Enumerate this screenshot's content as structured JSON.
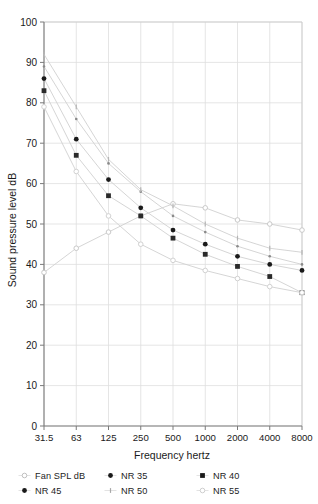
{
  "chart_data": {
    "type": "line",
    "title": "",
    "xlabel": "Frequency hertz",
    "ylabel": "Sound pressure level dB",
    "x_scale": "octave-band",
    "categories": [
      "31.5",
      "63",
      "125",
      "250",
      "500",
      "1000",
      "2000",
      "4000",
      "8000"
    ],
    "xtick_labels": [
      "31.5",
      "63",
      "125",
      "250",
      "500",
      "1000",
      "2000",
      "4000",
      "8000"
    ],
    "ytick_labels": [
      "0",
      "10",
      "20",
      "30",
      "40",
      "50",
      "60",
      "70",
      "80",
      "90",
      "100"
    ],
    "ylim": [
      0,
      100
    ],
    "ystep": 10,
    "grid": true,
    "legend_position": "bottom",
    "series": [
      {
        "name": "Fan SPL dB",
        "marker": "open-circle",
        "color": "#c9c9c9",
        "values": [
          38,
          44,
          48,
          52,
          55,
          54,
          51,
          50,
          48.5
        ]
      },
      {
        "name": "NR 35",
        "marker": "small-dot",
        "color": "#8a8a8a",
        "values": [
          89,
          76,
          65,
          58,
          52,
          48,
          44.5,
          42,
          40
        ]
      },
      {
        "name": "NR 40",
        "marker": "square",
        "color": "#2a2a2a",
        "values": [
          83,
          67,
          57,
          52,
          46.5,
          42.5,
          39.5,
          37,
          33
        ]
      },
      {
        "name": "NR 45",
        "marker": "dot",
        "color": "#1a1a1a",
        "values": [
          86,
          71,
          61,
          54,
          48.5,
          45,
          42,
          40,
          38.5
        ]
      },
      {
        "name": "NR 50",
        "marker": "tick",
        "color": "#b5b5b5",
        "values": [
          92,
          79,
          66,
          58.5,
          54.5,
          50,
          46.5,
          44,
          43
        ]
      },
      {
        "name": "NR 55",
        "marker": "open-circle-lite",
        "color": "#d2d2d2",
        "values": [
          79,
          63,
          52,
          45,
          41,
          38.5,
          36.5,
          34.5,
          33
        ]
      }
    ],
    "extra_series_note": "",
    "plotted_points": {
      "NR35_filled": [
        89,
        76,
        65,
        58,
        52,
        48,
        44.5,
        42,
        40
      ],
      "NR40_filled": [
        83,
        67,
        57,
        52,
        46.5,
        42.5,
        39.5,
        37,
        33
      ],
      "NR45_filled": [
        86,
        71,
        61,
        54,
        48.5,
        45,
        42,
        40,
        38.5
      ],
      "NR55_filled": [
        79,
        63,
        52,
        45,
        41,
        38.5,
        36.5,
        34.5,
        27.5
      ]
    }
  },
  "axes": {
    "ylabel": "Sound pressure level dB",
    "xlabel": "Frequency hertz",
    "y_ticks": [
      "100",
      "90",
      "80",
      "70",
      "60",
      "50",
      "40",
      "30",
      "20",
      "10",
      "0"
    ],
    "x_ticks": [
      "31.5",
      "63",
      "125",
      "250",
      "500",
      "1000",
      "2000",
      "4000",
      "8000"
    ]
  },
  "legend": {
    "items": [
      {
        "label": "Fan SPL dB",
        "marker": "open-circle",
        "color": "#c0c0c0"
      },
      {
        "label": "NR 35",
        "marker": "dot",
        "color": "#1a1a1a"
      },
      {
        "label": "NR 40",
        "marker": "square",
        "color": "#1a1a1a"
      },
      {
        "label": "NR 45",
        "marker": "dot",
        "color": "#1a1a1a"
      },
      {
        "label": "NR 50",
        "marker": "tick",
        "color": "#a8a8a8"
      },
      {
        "label": "NR 55",
        "marker": "open-circle",
        "color": "#cfcfcf"
      }
    ]
  }
}
